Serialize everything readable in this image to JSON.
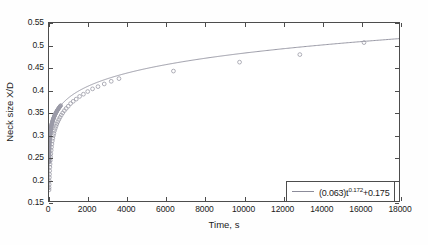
{
  "chart_data": {
    "type": "line",
    "title": "",
    "xlabel": "Time, s",
    "ylabel": "Neck size X/D",
    "xlim": [
      0,
      18000
    ],
    "ylim": [
      0.15,
      0.55
    ],
    "xticks": [
      0,
      2000,
      4000,
      6000,
      8000,
      10000,
      12000,
      14000,
      16000,
      18000
    ],
    "xtick_labels": [
      "0",
      "2000",
      "4000",
      "6000",
      "8000",
      "10000",
      "12000",
      "14000",
      "16000",
      "18000"
    ],
    "yticks": [
      0.15,
      0.2,
      0.25,
      0.3,
      0.35,
      0.4,
      0.45,
      0.5,
      0.55
    ],
    "ytick_labels": [
      "0.15",
      "0.2",
      "0.25",
      "0.3",
      "0.35",
      "0.4",
      "0.45",
      "0.5",
      "0.55"
    ],
    "grid": false,
    "legend_position": "lower right",
    "series": [
      {
        "name": "(0.063)t^0.172+0.175",
        "marker": "circle",
        "line_color": "#8c8c9a",
        "marker_color": "#9a9aa6",
        "fit": {
          "a": 0.063,
          "b": 0.172,
          "c": 0.175
        },
        "x": [
          2,
          5,
          9,
          14,
          20,
          27,
          35,
          44,
          54,
          66,
          80,
          95,
          112,
          130,
          150,
          172,
          196,
          222,
          250,
          282,
          318,
          358,
          402,
          450,
          505,
          565,
          632,
          706,
          790,
          884,
          990,
          1110,
          1245,
          1400,
          1575,
          1770,
          1990,
          2240,
          2520,
          2840,
          3200,
          3600,
          6400,
          9800,
          12900,
          16200
        ],
        "y": [
          0.175,
          0.18,
          0.187,
          0.195,
          0.203,
          0.21,
          0.218,
          0.226,
          0.233,
          0.241,
          0.249,
          0.256,
          0.264,
          0.271,
          0.278,
          0.285,
          0.291,
          0.297,
          0.302,
          0.308,
          0.313,
          0.318,
          0.323,
          0.328,
          0.333,
          0.338,
          0.343,
          0.348,
          0.353,
          0.358,
          0.363,
          0.369,
          0.374,
          0.379,
          0.385,
          0.39,
          0.396,
          0.402,
          0.407,
          0.413,
          0.419,
          0.425,
          0.442,
          0.462,
          0.479,
          0.506
        ]
      }
    ]
  },
  "axes": {
    "x_title": "Time, s",
    "y_title": "Neck size X/D"
  },
  "legend": {
    "entry_prefix": "(0.063)t",
    "entry_exponent": "0.172",
    "entry_suffix": "+0.175"
  }
}
